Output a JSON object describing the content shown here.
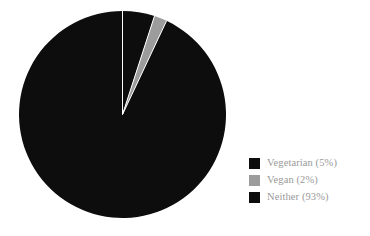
{
  "background_color": "#ffffff",
  "chart_data": {
    "type": "pie",
    "title": "",
    "subtitle": "",
    "xlabel": "",
    "ylabel": "",
    "grid": false,
    "legend_position": "right",
    "start_angle_deg": 0,
    "direction": "clockwise",
    "categories": [
      "Vegetarian",
      "Vegan",
      "Neither"
    ],
    "values": [
      5,
      2,
      93
    ],
    "value_unit": "%",
    "colors": [
      "#0d0d0d",
      "#9c9c9c",
      "#0d0d0d"
    ],
    "slice_separator_color": "#ffffff",
    "slices": [
      {
        "label": "Vegetarian",
        "value": 5,
        "display": "Vegetarian (5%)",
        "color": "#0d0d0d"
      },
      {
        "label": "Vegan",
        "value": 2,
        "display": "Vegan (2%)",
        "color": "#9c9c9c"
      },
      {
        "label": "Neither",
        "value": 93,
        "display": "Neither (93%)",
        "color": "#0d0d0d"
      }
    ]
  },
  "legend": {
    "items": [
      {
        "label": "Vegetarian (5%)",
        "color": "#0d0d0d",
        "swatch_name": "legend-swatch-vegetarian"
      },
      {
        "label": "Vegan (2%)",
        "color": "#9c9c9c",
        "swatch_name": "legend-swatch-vegan"
      },
      {
        "label": "Neither (93%)",
        "color": "#0d0d0d",
        "swatch_name": "legend-swatch-neither"
      }
    ]
  }
}
